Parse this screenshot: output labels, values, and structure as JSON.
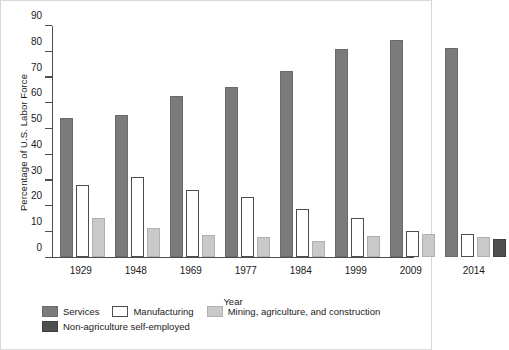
{
  "chart_data": {
    "type": "bar",
    "title": "",
    "xlabel": "Year",
    "ylabel": "Percentage of U.S. Labor Force",
    "categories": [
      "1929",
      "1948",
      "1969",
      "1977",
      "1984",
      "1999",
      "2009",
      "2014"
    ],
    "series": [
      {
        "name": "Services",
        "color": "#7b7b7b",
        "values": [
          54,
          55,
          62.5,
          66,
          72,
          80.5,
          84,
          81
        ]
      },
      {
        "name": "Manufacturing",
        "color": "#ffffff",
        "values": [
          28,
          31,
          26,
          23,
          18.5,
          15,
          10,
          9
        ]
      },
      {
        "name": "Mining, agriculture, and construction",
        "color": "#c9c9c9",
        "values": [
          15,
          11,
          8.5,
          7.5,
          6,
          8,
          9,
          7.5
        ]
      },
      {
        "name": "Non-agriculture self-employed",
        "color": "#4f4f4f",
        "values": [
          null,
          null,
          null,
          null,
          null,
          null,
          null,
          7
        ]
      }
    ],
    "ylim": [
      0,
      90
    ],
    "yticks": [
      0,
      10,
      20,
      30,
      40,
      50,
      60,
      70,
      80,
      90
    ],
    "ytick_labels": [
      "0",
      "10",
      "20",
      "30",
      "40",
      "50",
      "60",
      "70",
      "80",
      "90"
    ],
    "grid": false,
    "legend_position": "bottom"
  },
  "legend": {
    "items": [
      {
        "label": "Services",
        "swatch": "services"
      },
      {
        "label": "Manufacturing",
        "swatch": "manufacturing"
      },
      {
        "label": "Mining, agriculture, and construction",
        "swatch": "mining"
      },
      {
        "label": "Non-agriculture self-employed",
        "swatch": "selfemp"
      }
    ]
  }
}
